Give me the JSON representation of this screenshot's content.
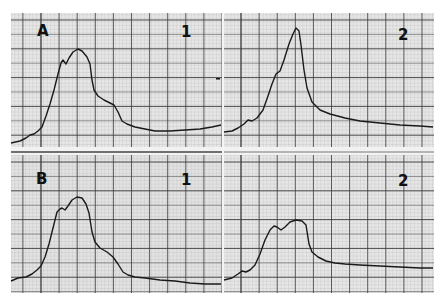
{
  "figure": {
    "background_paper": "#e9e9e9",
    "minor_grid_color": "#a8a8a8",
    "major_grid_color": "#3a3a3a",
    "trace_color": "#1a1a1a"
  },
  "chart_data": [
    {
      "type": "line",
      "panel": "A1",
      "row_label": "A",
      "col_label": "1",
      "title": "",
      "xlabel": "",
      "ylabel": "",
      "grid": true,
      "bounds": {
        "x": 11,
        "y": 13,
        "w": 211,
        "h": 134
      },
      "points": [
        [
          11,
          143
        ],
        [
          20,
          141
        ],
        [
          26,
          138
        ],
        [
          30,
          135
        ],
        [
          34,
          134
        ],
        [
          38,
          131
        ],
        [
          42,
          127
        ],
        [
          46,
          116
        ],
        [
          50,
          104
        ],
        [
          54,
          90
        ],
        [
          58,
          74
        ],
        [
          61,
          63
        ],
        [
          63,
          60
        ],
        [
          66,
          64
        ],
        [
          69,
          58
        ],
        [
          73,
          52
        ],
        [
          78,
          49
        ],
        [
          82,
          51
        ],
        [
          87,
          57
        ],
        [
          90,
          64
        ],
        [
          92,
          80
        ],
        [
          94,
          90
        ],
        [
          98,
          96
        ],
        [
          104,
          100
        ],
        [
          110,
          103
        ],
        [
          114,
          105
        ],
        [
          118,
          112
        ],
        [
          122,
          121
        ],
        [
          127,
          124
        ],
        [
          135,
          127
        ],
        [
          145,
          129
        ],
        [
          155,
          131
        ],
        [
          170,
          131
        ],
        [
          185,
          130
        ],
        [
          200,
          129
        ],
        [
          212,
          127
        ],
        [
          221,
          125
        ]
      ]
    },
    {
      "type": "line",
      "panel": "A2",
      "row_label": "2",
      "col_label": "2",
      "title": "",
      "xlabel": "",
      "ylabel": "",
      "grid": true,
      "bounds": {
        "x": 224,
        "y": 13,
        "w": 210,
        "h": 134
      },
      "points": [
        [
          224,
          132
        ],
        [
          232,
          131
        ],
        [
          238,
          128
        ],
        [
          244,
          124
        ],
        [
          248,
          120
        ],
        [
          252,
          121
        ],
        [
          257,
          118
        ],
        [
          263,
          110
        ],
        [
          268,
          96
        ],
        [
          272,
          84
        ],
        [
          276,
          74
        ],
        [
          280,
          71
        ],
        [
          284,
          60
        ],
        [
          289,
          44
        ],
        [
          293,
          34
        ],
        [
          296,
          28
        ],
        [
          299,
          31
        ],
        [
          301,
          45
        ],
        [
          304,
          70
        ],
        [
          307,
          88
        ],
        [
          312,
          102
        ],
        [
          320,
          110
        ],
        [
          330,
          114
        ],
        [
          345,
          118
        ],
        [
          360,
          121
        ],
        [
          380,
          123
        ],
        [
          400,
          125
        ],
        [
          420,
          126
        ],
        [
          433,
          127
        ]
      ]
    },
    {
      "type": "line",
      "panel": "B1",
      "row_label": "B",
      "col_label": "1",
      "title": "",
      "xlabel": "",
      "ylabel": "",
      "grid": true,
      "bounds": {
        "x": 11,
        "y": 155,
        "w": 211,
        "h": 138
      },
      "points": [
        [
          11,
          281
        ],
        [
          18,
          278
        ],
        [
          26,
          277
        ],
        [
          32,
          274
        ],
        [
          37,
          270
        ],
        [
          41,
          266
        ],
        [
          45,
          257
        ],
        [
          49,
          244
        ],
        [
          53,
          228
        ],
        [
          57,
          212
        ],
        [
          60,
          209
        ],
        [
          62,
          208
        ],
        [
          65,
          210
        ],
        [
          68,
          206
        ],
        [
          72,
          200
        ],
        [
          77,
          197
        ],
        [
          82,
          198
        ],
        [
          86,
          204
        ],
        [
          89,
          213
        ],
        [
          92,
          232
        ],
        [
          95,
          242
        ],
        [
          100,
          248
        ],
        [
          107,
          252
        ],
        [
          113,
          257
        ],
        [
          118,
          264
        ],
        [
          123,
          272
        ],
        [
          128,
          275
        ],
        [
          135,
          277
        ],
        [
          145,
          278
        ],
        [
          160,
          280
        ],
        [
          175,
          281
        ],
        [
          190,
          283
        ],
        [
          205,
          284
        ],
        [
          221,
          284
        ]
      ]
    },
    {
      "type": "line",
      "panel": "B2",
      "row_label": "",
      "col_label": "2",
      "title": "",
      "xlabel": "",
      "ylabel": "",
      "grid": true,
      "bounds": {
        "x": 224,
        "y": 155,
        "w": 210,
        "h": 138
      },
      "points": [
        [
          224,
          280
        ],
        [
          232,
          278
        ],
        [
          238,
          274
        ],
        [
          242,
          271
        ],
        [
          246,
          272
        ],
        [
          250,
          270
        ],
        [
          255,
          265
        ],
        [
          260,
          254
        ],
        [
          265,
          240
        ],
        [
          270,
          230
        ],
        [
          274,
          226
        ],
        [
          277,
          227
        ],
        [
          281,
          230
        ],
        [
          285,
          227
        ],
        [
          290,
          222
        ],
        [
          296,
          220
        ],
        [
          302,
          221
        ],
        [
          306,
          225
        ],
        [
          309,
          244
        ],
        [
          312,
          252
        ],
        [
          318,
          257
        ],
        [
          326,
          261
        ],
        [
          335,
          263
        ],
        [
          345,
          264
        ],
        [
          360,
          265
        ],
        [
          380,
          266
        ],
        [
          400,
          267
        ],
        [
          420,
          268
        ],
        [
          433,
          268
        ]
      ]
    }
  ],
  "labels": {
    "a_row": "A",
    "b_row": "B",
    "a1_col": "1",
    "a2_col": "2",
    "b1_col": "1",
    "b2_col": "2"
  }
}
